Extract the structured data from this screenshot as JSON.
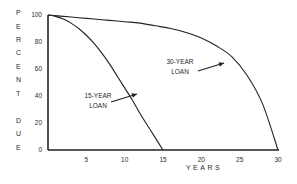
{
  "chart_data": {
    "type": "line",
    "title": "",
    "xlabel": "YEARS",
    "ylabel": "PERCENT DUE",
    "ylabel_letters": [
      "P",
      "E",
      "R",
      "C",
      "E",
      "N",
      "T",
      "D",
      "U",
      "E"
    ],
    "xlim": [
      0,
      30
    ],
    "ylim": [
      0,
      100
    ],
    "x_ticks": [
      "5",
      "10",
      "15",
      "20",
      "25",
      "30"
    ],
    "y_ticks": [
      "100",
      "80",
      "60",
      "40",
      "20",
      "0"
    ],
    "grid": false,
    "legend": "none",
    "series": [
      {
        "name": "15-YEAR LOAN",
        "x": [
          0,
          1,
          2,
          3,
          4,
          5,
          6,
          7,
          8,
          9,
          10,
          11,
          12,
          13,
          14,
          15
        ],
        "values": [
          100,
          99,
          97,
          94,
          90,
          85,
          79,
          72,
          64,
          55,
          46,
          37,
          27,
          18,
          9,
          0
        ]
      },
      {
        "name": "30-YEAR LOAN",
        "x": [
          0,
          2,
          4,
          6,
          8,
          10,
          12,
          14,
          16,
          18,
          20,
          22,
          24,
          26,
          28,
          30
        ],
        "values": [
          100,
          99,
          98,
          97,
          96,
          95,
          94,
          92,
          90,
          87,
          83,
          77,
          69,
          55,
          34,
          0
        ]
      }
    ],
    "annotations": [
      {
        "text_line1": "15-YEAR",
        "text_line2": "LOAN",
        "points_to_series": "15-YEAR LOAN"
      },
      {
        "text_line1": "30-YEAR",
        "text_line2": "LOAN",
        "points_to_series": "30-YEAR LOAN"
      }
    ]
  },
  "colors": {
    "line": "#222222",
    "text": "#2a2a2a",
    "background": "#ffffff"
  }
}
